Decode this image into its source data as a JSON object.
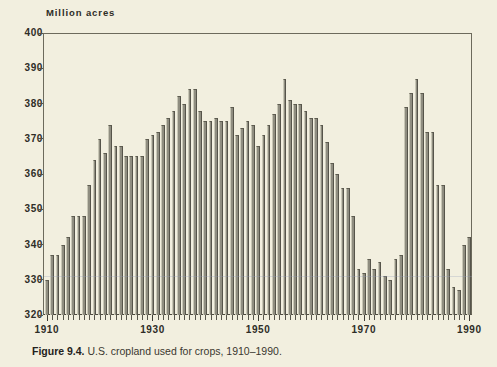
{
  "figure": {
    "caption_number": "Figure 9.4.",
    "caption_text": " U.S. cropland used for crops, 1910–1990.",
    "background_color": "#f2efdf",
    "bar_color": "#8f8d80",
    "axis_color": "#55524a",
    "text_color": "#2e2d27"
  },
  "chart_data": {
    "type": "bar",
    "title": "",
    "subtitle": "",
    "unit_label": "Million acres",
    "xlabel": "",
    "ylabel": "Million acres",
    "ylim": [
      320,
      400
    ],
    "xlim": [
      1910,
      1990
    ],
    "y_ticks": [
      320,
      330,
      340,
      350,
      360,
      370,
      380,
      390,
      400
    ],
    "y_tick_labels": [
      "320",
      "330",
      "340",
      "350",
      "360",
      "370",
      "380",
      "390",
      "400"
    ],
    "x_ticks": [
      1910,
      1930,
      1950,
      1970,
      1990
    ],
    "x_tick_labels": [
      "1910",
      "1930",
      "1950",
      "1970",
      "1990"
    ],
    "x_minor_tick_interval": 1,
    "grid": false,
    "legend": null,
    "legend_position": "none",
    "categories": [
      1910,
      1911,
      1912,
      1913,
      1914,
      1915,
      1916,
      1917,
      1918,
      1919,
      1920,
      1921,
      1922,
      1923,
      1924,
      1925,
      1926,
      1927,
      1928,
      1929,
      1930,
      1931,
      1932,
      1933,
      1934,
      1935,
      1936,
      1937,
      1938,
      1939,
      1940,
      1941,
      1942,
      1943,
      1944,
      1945,
      1946,
      1947,
      1948,
      1949,
      1950,
      1951,
      1952,
      1953,
      1954,
      1955,
      1956,
      1957,
      1958,
      1959,
      1960,
      1961,
      1962,
      1963,
      1964,
      1965,
      1966,
      1967,
      1968,
      1969,
      1970,
      1971,
      1972,
      1973,
      1974,
      1975,
      1976,
      1977,
      1978,
      1979,
      1980,
      1981,
      1982,
      1983,
      1984,
      1985,
      1986,
      1987,
      1988,
      1989,
      1990
    ],
    "values": [
      330,
      337,
      337,
      340,
      342,
      348,
      348,
      348,
      357,
      364,
      370,
      366,
      374,
      368,
      368,
      365,
      365,
      365,
      365,
      370,
      371,
      372,
      374,
      376,
      378,
      382,
      380,
      384,
      384,
      378,
      375,
      375,
      376,
      375,
      375,
      379,
      371,
      373,
      375,
      374,
      368,
      371,
      374,
      377,
      380,
      387,
      381,
      380,
      380,
      378,
      376,
      376,
      374,
      369,
      363,
      360,
      356,
      356,
      348,
      333,
      332,
      336,
      333,
      335,
      331,
      330,
      336,
      337,
      331,
      331,
      330,
      334,
      327,
      337,
      335,
      332,
      333,
      338,
      347,
      370,
      377
    ],
    "series": [
      {
        "name": "U.S. cropland used for crops",
        "unit": "million acres",
        "values": [
          330,
          337,
          337,
          340,
          342,
          348,
          348,
          348,
          357,
          364,
          370,
          366,
          374,
          368,
          368,
          365,
          365,
          365,
          365,
          370,
          371,
          372,
          374,
          376,
          378,
          382,
          380,
          384,
          384,
          378,
          375,
          375,
          376,
          375,
          375,
          379,
          371,
          373,
          375,
          374,
          368,
          371,
          374,
          377,
          380,
          387,
          381,
          380,
          380,
          378,
          376,
          376,
          374,
          369,
          363,
          360,
          356,
          356,
          348,
          333,
          332,
          336,
          333,
          335,
          331,
          330,
          336,
          337,
          331,
          331,
          330,
          334,
          327,
          337,
          335,
          332,
          333,
          338,
          347,
          370,
          377
        ]
      }
    ],
    "values_tail": [
      379,
      383,
      387,
      383,
      372,
      372,
      357,
      357,
      333,
      328,
      327,
      340,
      342
    ],
    "annotations": []
  }
}
